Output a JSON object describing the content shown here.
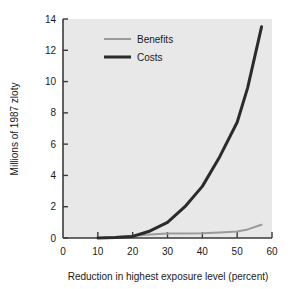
{
  "chart_data": {
    "type": "line",
    "title": "",
    "xlabel": "Reduction in highest exposure level (percent)",
    "ylabel": "Millions of 1987 zloty",
    "xlim": [
      0,
      60
    ],
    "ylim": [
      0,
      14
    ],
    "xticks": [
      "0",
      "10",
      "20",
      "30",
      "40",
      "50",
      "60"
    ],
    "yticks": [
      "0",
      "2",
      "4",
      "6",
      "8",
      "10",
      "12",
      "14"
    ],
    "grid": false,
    "legend_position": "top-left-inside",
    "plot_background": "#e8e8e8",
    "page_background": "#ffffff",
    "axis_color": "#3a3a3a",
    "series": [
      {
        "name": "Benefits",
        "color": "#9a9a9a",
        "line_width": 2,
        "x": [
          11,
          15,
          20,
          25,
          30,
          35,
          40,
          45,
          50,
          53,
          57
        ],
        "values": [
          0.0,
          0.06,
          0.15,
          0.22,
          0.28,
          0.29,
          0.3,
          0.35,
          0.42,
          0.55,
          0.85
        ]
      },
      {
        "name": "Costs",
        "color": "#2b2b2b",
        "line_width": 3,
        "x": [
          10,
          15,
          20,
          25,
          30,
          35,
          40,
          45,
          50,
          53,
          57
        ],
        "values": [
          0.0,
          0.03,
          0.1,
          0.45,
          1.0,
          2.0,
          3.3,
          5.2,
          7.4,
          9.6,
          13.5
        ]
      }
    ]
  },
  "legend": {
    "items": [
      {
        "label": "Benefits"
      },
      {
        "label": "Costs"
      }
    ]
  }
}
